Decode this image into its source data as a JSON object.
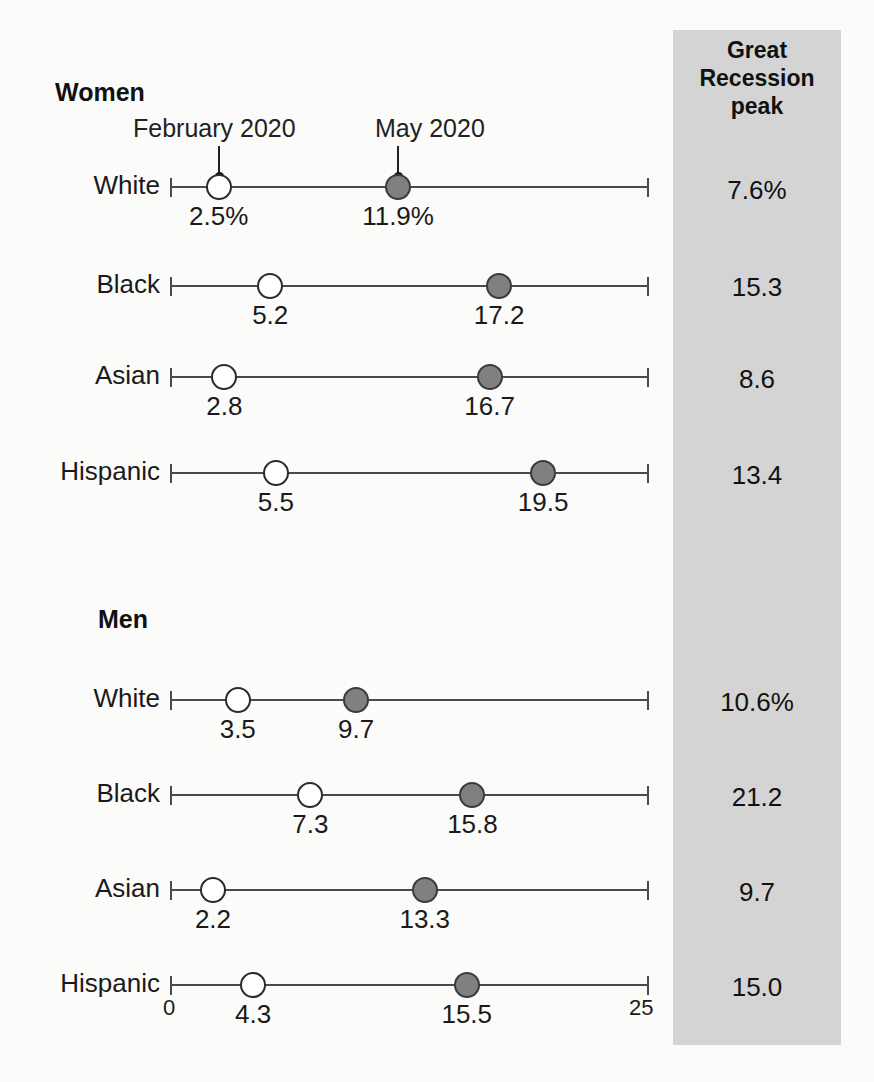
{
  "chart_data": {
    "type": "scatter",
    "title": "",
    "xlabel": "",
    "ylabel": "",
    "xlim": [
      0,
      25
    ],
    "grid": false,
    "legend_position": "inline-callout",
    "axis_ticks": {
      "min_label": "0",
      "max_label": "25"
    },
    "series": [
      {
        "name": "February 2020",
        "marker": "open-circle"
      },
      {
        "name": "May 2020",
        "marker": "filled-circle"
      }
    ],
    "groups": [
      {
        "name": "Women",
        "rows": [
          {
            "category": "White",
            "february_2020": 2.5,
            "may_2020": 11.9,
            "february_label": "2.5%",
            "may_label": "11.9%",
            "great_recession_peak": "7.6%"
          },
          {
            "category": "Black",
            "february_2020": 5.2,
            "may_2020": 17.2,
            "february_label": "5.2",
            "may_label": "17.2",
            "great_recession_peak": "15.3"
          },
          {
            "category": "Asian",
            "february_2020": 2.8,
            "may_2020": 16.7,
            "february_label": "2.8",
            "may_label": "16.7",
            "great_recession_peak": "8.6"
          },
          {
            "category": "Hispanic",
            "february_2020": 5.5,
            "may_2020": 19.5,
            "february_label": "5.5",
            "may_label": "19.5",
            "great_recession_peak": "13.4"
          }
        ]
      },
      {
        "name": "Men",
        "rows": [
          {
            "category": "White",
            "february_2020": 3.5,
            "may_2020": 9.7,
            "february_label": "3.5",
            "may_label": "9.7",
            "great_recession_peak": "10.6%"
          },
          {
            "category": "Black",
            "february_2020": 7.3,
            "may_2020": 15.8,
            "february_label": "7.3",
            "may_label": "15.8",
            "great_recession_peak": "21.2"
          },
          {
            "category": "Asian",
            "february_2020": 2.2,
            "may_2020": 13.3,
            "february_label": "2.2",
            "may_label": "13.3",
            "great_recession_peak": "9.7"
          },
          {
            "category": "Hispanic",
            "february_2020": 4.3,
            "may_2020": 15.5,
            "february_label": "4.3",
            "may_label": "15.5",
            "great_recession_peak": "15.0"
          }
        ]
      }
    ]
  },
  "panel": {
    "header_line1": "Great",
    "header_line2": "Recession",
    "header_line3": "peak",
    "background_color": "#d4d4d4",
    "values": [
      "7.6%",
      "15.3",
      "8.6",
      "13.4",
      "10.6%",
      "21.2",
      "9.7",
      "15.0"
    ]
  },
  "headings": {
    "women": "Women",
    "men": "Men"
  },
  "callouts": {
    "february": "February 2020",
    "may": "May 2020"
  },
  "axis": {
    "min": "0",
    "max": "25"
  },
  "colors": {
    "open_marker": "#ffffff",
    "filled_marker": "#808080",
    "line": "#4a4a4a",
    "panel": "#d4d4d4",
    "text": "#1a1a1a"
  }
}
